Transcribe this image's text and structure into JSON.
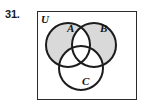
{
  "problem": {
    "number": "31."
  },
  "figure": {
    "type": "venn-diagram",
    "universe_label": "U",
    "sets": [
      {
        "id": "A",
        "label": "A",
        "cx": 31,
        "cy": 34,
        "r": 22
      },
      {
        "id": "B",
        "label": "B",
        "cx": 57,
        "cy": 34,
        "r": 22
      },
      {
        "id": "C",
        "label": "C",
        "cx": 44,
        "cy": 57,
        "r": 22
      }
    ],
    "shaded_description": "symmetric difference of A and B, excluding C",
    "shaded_regions": [
      "A only",
      "A intersect B complement of C",
      "B only"
    ],
    "unshaded_regions": [
      "A intersect B only",
      "A intersect B intersect C",
      "A intersect C only",
      "B intersect C only",
      "C only",
      "outside all sets"
    ],
    "colors": {
      "shading": "#d9d9d9",
      "stroke": "#1c1c1c",
      "box_stroke": "#2b2b2b",
      "background": "#ffffff",
      "text": "#141414"
    },
    "stroke_width": 2.0,
    "box_stroke_width": 1.6
  }
}
